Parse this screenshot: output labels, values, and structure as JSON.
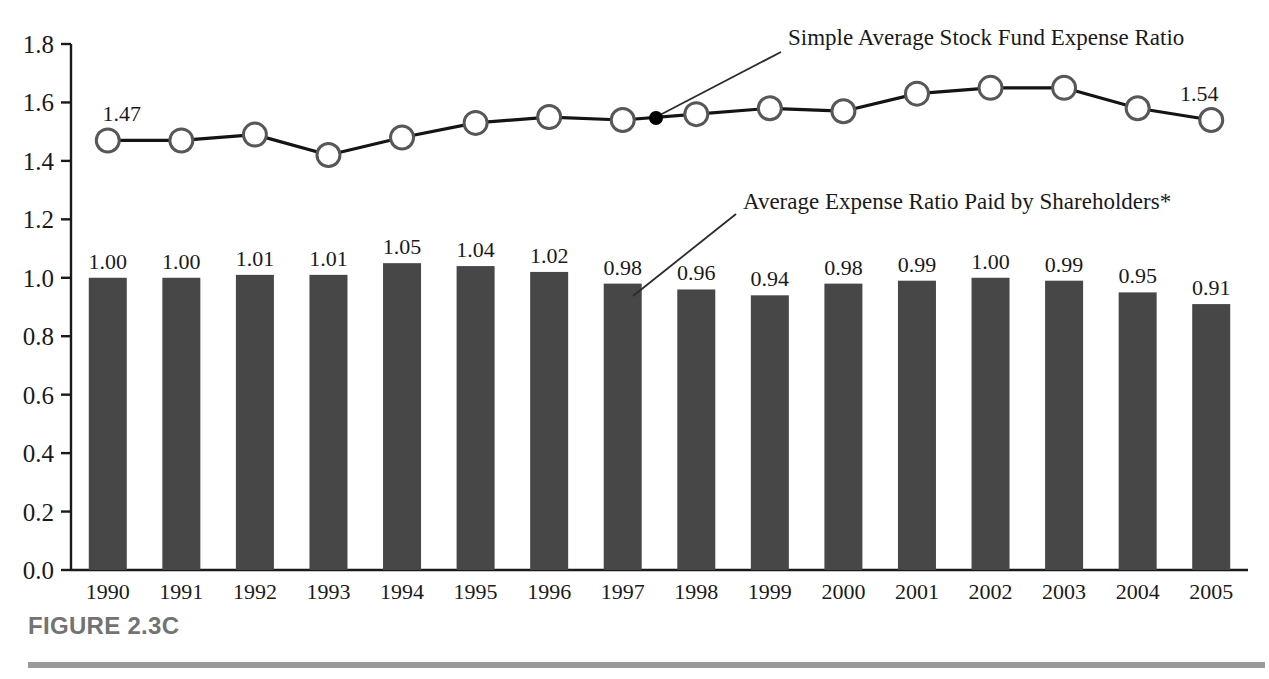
{
  "caption": {
    "label": "FIGURE 2.3C"
  },
  "annotations": [
    {
      "name": "line-series-annotation",
      "text": "Simple Average Stock Fund Expense Ratio",
      "text_x": 788,
      "text_y": 45,
      "leader": {
        "x1": 781,
        "y1": 52,
        "x2": 658,
        "y2": 116
      },
      "anchor_dot": {
        "x": 656,
        "y": 118,
        "r": 7
      }
    },
    {
      "name": "bar-series-annotation",
      "text": "Average Expense Ratio Paid by Shareholders*",
      "text_x": 743,
      "text_y": 209,
      "leader": {
        "x1": 736,
        "y1": 214,
        "x2": 633,
        "y2": 296
      },
      "anchor_dot": null
    }
  ],
  "axis": {
    "y_ticks": [
      "1.8",
      "1.6",
      "1.4",
      "1.2",
      "1.0",
      "0.8",
      "0.6",
      "0.4",
      "0.2",
      "0.0"
    ],
    "y_tick_values": [
      1.8,
      1.6,
      1.4,
      1.2,
      1.0,
      0.8,
      0.6,
      0.4,
      0.2,
      0.0
    ],
    "axis_color": "#1a1a1a"
  },
  "colors": {
    "bar_fill": "#474747",
    "line_stroke": "#141414",
    "marker_fill": "#ffffff",
    "marker_stroke": "#575757",
    "caption_text": "#737373",
    "rule": "#9a9a9a"
  },
  "chart_data": {
    "type": "bar",
    "title": "FIGURE 2.3C",
    "xlabel": "",
    "ylabel": "",
    "ylim": [
      0.0,
      1.8
    ],
    "grid": false,
    "legend_position": "annotated-inline",
    "categories": [
      "1990",
      "1991",
      "1992",
      "1993",
      "1994",
      "1995",
      "1996",
      "1997",
      "1998",
      "1999",
      "2000",
      "2001",
      "2002",
      "2003",
      "2004",
      "2005"
    ],
    "series": [
      {
        "name": "Average Expense Ratio Paid by Shareholders*",
        "type": "bar",
        "values": [
          1.0,
          1.0,
          1.01,
          1.01,
          1.05,
          1.04,
          1.02,
          0.98,
          0.96,
          0.94,
          0.98,
          0.99,
          1.0,
          0.99,
          0.95,
          0.91
        ],
        "labels": [
          "1.00",
          "1.00",
          "1.01",
          "1.01",
          "1.05",
          "1.04",
          "1.02",
          "0.98",
          "0.96",
          "0.94",
          "0.98",
          "0.99",
          "1.00",
          "0.99",
          "0.95",
          "0.91"
        ],
        "labels_shown": [
          true,
          true,
          true,
          true,
          true,
          true,
          true,
          true,
          true,
          true,
          true,
          true,
          true,
          true,
          true,
          true
        ]
      },
      {
        "name": "Simple Average Stock Fund Expense Ratio",
        "type": "line",
        "values": [
          1.47,
          1.47,
          1.49,
          1.42,
          1.48,
          1.53,
          1.55,
          1.54,
          1.56,
          1.58,
          1.57,
          1.63,
          1.65,
          1.65,
          1.58,
          1.54
        ],
        "labels": [
          "1.47",
          "",
          "",
          "",
          "",
          "",
          "",
          "",
          "",
          "",
          "",
          "",
          "",
          "",
          "",
          "1.54"
        ],
        "labels_shown": [
          true,
          false,
          false,
          false,
          false,
          false,
          false,
          false,
          false,
          false,
          false,
          false,
          false,
          false,
          false,
          true
        ]
      }
    ]
  }
}
